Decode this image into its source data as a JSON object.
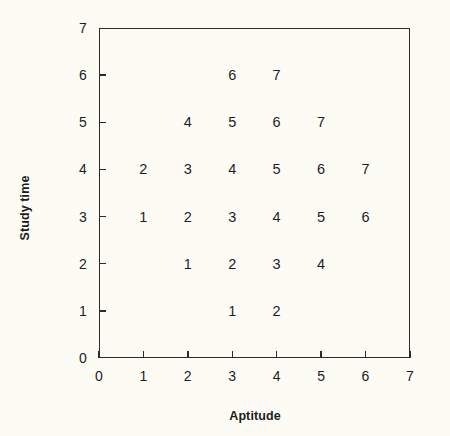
{
  "chart_data": {
    "type": "scatter",
    "title": "",
    "subtitle": "",
    "xlabel": "Aptitude",
    "ylabel": "Study time",
    "xlim": [
      0,
      7
    ],
    "ylim": [
      0,
      7
    ],
    "xticks": [
      "0",
      "1",
      "2",
      "3",
      "4",
      "5",
      "6",
      "7"
    ],
    "yticks": [
      "0",
      "1",
      "2",
      "3",
      "4",
      "5",
      "6",
      "7"
    ],
    "xtick_values": [
      0,
      1,
      2,
      3,
      4,
      5,
      6,
      7
    ],
    "ytick_values": [
      0,
      1,
      2,
      3,
      4,
      5,
      6,
      7
    ],
    "grid": false,
    "legend": false,
    "legend_position": "none",
    "marker_style": "text-label",
    "annotations": [],
    "points": [
      {
        "x": 3,
        "y": 6,
        "label": "6"
      },
      {
        "x": 4,
        "y": 6,
        "label": "7"
      },
      {
        "x": 2,
        "y": 5,
        "label": "4"
      },
      {
        "x": 3,
        "y": 5,
        "label": "5"
      },
      {
        "x": 4,
        "y": 5,
        "label": "6"
      },
      {
        "x": 5,
        "y": 5,
        "label": "7"
      },
      {
        "x": 1,
        "y": 4,
        "label": "2"
      },
      {
        "x": 2,
        "y": 4,
        "label": "3"
      },
      {
        "x": 3,
        "y": 4,
        "label": "4"
      },
      {
        "x": 4,
        "y": 4,
        "label": "5"
      },
      {
        "x": 5,
        "y": 4,
        "label": "6"
      },
      {
        "x": 6,
        "y": 4,
        "label": "7"
      },
      {
        "x": 1,
        "y": 3,
        "label": "1"
      },
      {
        "x": 2,
        "y": 3,
        "label": "2"
      },
      {
        "x": 3,
        "y": 3,
        "label": "3"
      },
      {
        "x": 4,
        "y": 3,
        "label": "4"
      },
      {
        "x": 5,
        "y": 3,
        "label": "5"
      },
      {
        "x": 6,
        "y": 3,
        "label": "6"
      },
      {
        "x": 2,
        "y": 2,
        "label": "1"
      },
      {
        "x": 3,
        "y": 2,
        "label": "2"
      },
      {
        "x": 4,
        "y": 2,
        "label": "3"
      },
      {
        "x": 5,
        "y": 2,
        "label": "4"
      },
      {
        "x": 3,
        "y": 1,
        "label": "1"
      },
      {
        "x": 4,
        "y": 1,
        "label": "2"
      }
    ],
    "colors": {
      "axis": "#2b2b2b",
      "text": "#1d1d1d",
      "background": "#fdfcf4"
    }
  },
  "geometry": {
    "plot_left": 99,
    "plot_top": 28,
    "plot_width": 311,
    "plot_height": 330,
    "xlabel_x": 255,
    "xlabel_y": 416,
    "ylabel_x": 25,
    "ylabel_y": 208
  }
}
